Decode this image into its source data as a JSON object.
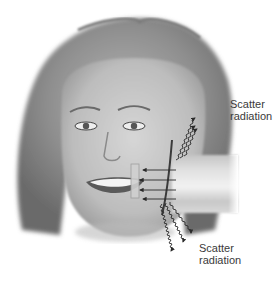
{
  "figure": {
    "colors": {
      "background": "#ffffff",
      "hair": "#8a8a8a",
      "skin": "#c8c8c8",
      "beam": "#d8d8d8",
      "arrows": "#2a2a2a",
      "text": "#3a3a3a"
    }
  },
  "labels": {
    "upper": {
      "line1": "Scatter",
      "line2": "radiation"
    },
    "lower": {
      "line1": "Scatter",
      "line2": "radiation"
    }
  },
  "elements": {
    "primary_beam_arrows": 4,
    "scatter_up_waves": 3,
    "scatter_down_waves": 3
  }
}
